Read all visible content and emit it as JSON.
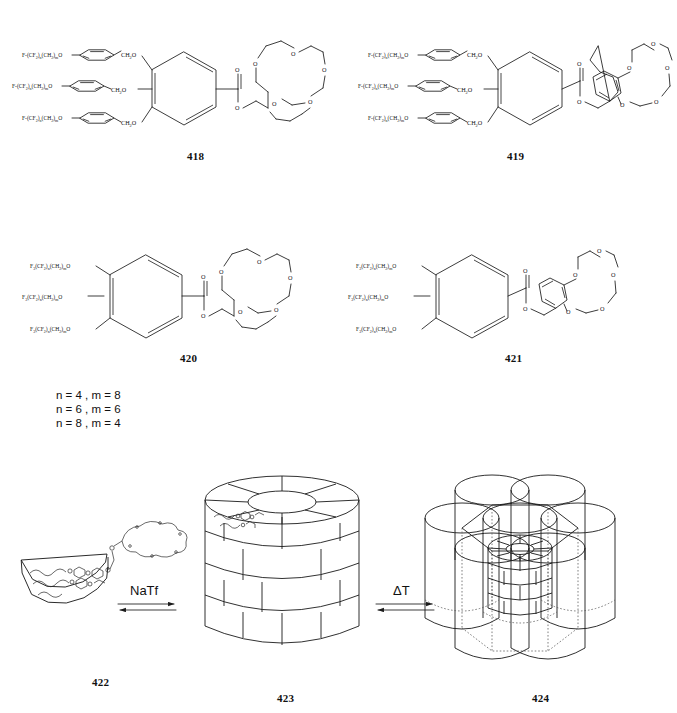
{
  "figure": {
    "kind": "chemical-scheme",
    "background": "#ffffff",
    "line_color": "#1a1a1a"
  },
  "structures": [
    {
      "id": "418",
      "number_label": "418",
      "core": "3,4,5-tris(benzyloxy)benzoate",
      "crown": "15-crown-5",
      "crown_type": "aliphatic",
      "arm_count": 3,
      "arm_label_prefix": "F-(CF",
      "arm_label": "F-(CF2)n(CH2)mO",
      "linker_labels": [
        "CH2O",
        "CH2O",
        "CH2O"
      ],
      "ester_oxygens": [
        "O",
        "O"
      ],
      "crown_oxygen_count": 5
    },
    {
      "id": "419",
      "number_label": "419",
      "core": "3,4,5-tris(benzyloxy)benzoate",
      "crown": "benzo-15-crown-5",
      "crown_type": "benzo",
      "arm_count": 3,
      "arm_label": "F-(CF2)n(CH2)mO",
      "linker_labels": [
        "CH2O",
        "CH2O",
        "CH2O"
      ],
      "ester_oxygens": [
        "O",
        "O"
      ],
      "crown_oxygen_count": 5
    },
    {
      "id": "420",
      "number_label": "420",
      "core": "3,4,5-trialkoxybenzoate",
      "crown": "15-crown-5",
      "crown_type": "aliphatic",
      "arm_count": 3,
      "arm_label": "F3(CF2)n(CH2)mO",
      "ester_oxygens": [
        "O",
        "O"
      ],
      "crown_oxygen_count": 5
    },
    {
      "id": "421",
      "number_label": "421",
      "core": "3,4,5-trialkoxybenzoate",
      "crown": "benzo-15-crown-5",
      "crown_type": "benzo",
      "arm_count": 3,
      "arm_label": "F3(CF2)n(CH2)mO",
      "ester_oxygens": [
        "O",
        "O"
      ],
      "crown_oxygen_count": 5
    }
  ],
  "chain_legend": {
    "lines": [
      "n = 4 , m = 8",
      "n = 6 , m = 6",
      "n = 8 , m = 4"
    ],
    "line1": "n = 4 , m = 8",
    "line2": "n = 6 , m = 6",
    "line3": "n = 8 , m = 4"
  },
  "assembly_scheme": {
    "steps": [
      {
        "id": "422",
        "number_label": "422",
        "shape": "tapered wedge (dendron) with fluorinated tails and crown ether head"
      },
      {
        "id": "423",
        "number_label": "423",
        "shape": "supramolecular column of stacked disks"
      },
      {
        "id": "424",
        "number_label": "424",
        "shape": "hexagonal columnar array of seven cylinders"
      }
    ],
    "arrows": [
      {
        "label": "NaTf",
        "reversible": true,
        "from": "422",
        "to": "423"
      },
      {
        "label": "ΔT",
        "reversible": true,
        "from": "423",
        "to": "424"
      }
    ],
    "arrow1_label": "NaTf",
    "arrow2_label": "ΔT"
  }
}
